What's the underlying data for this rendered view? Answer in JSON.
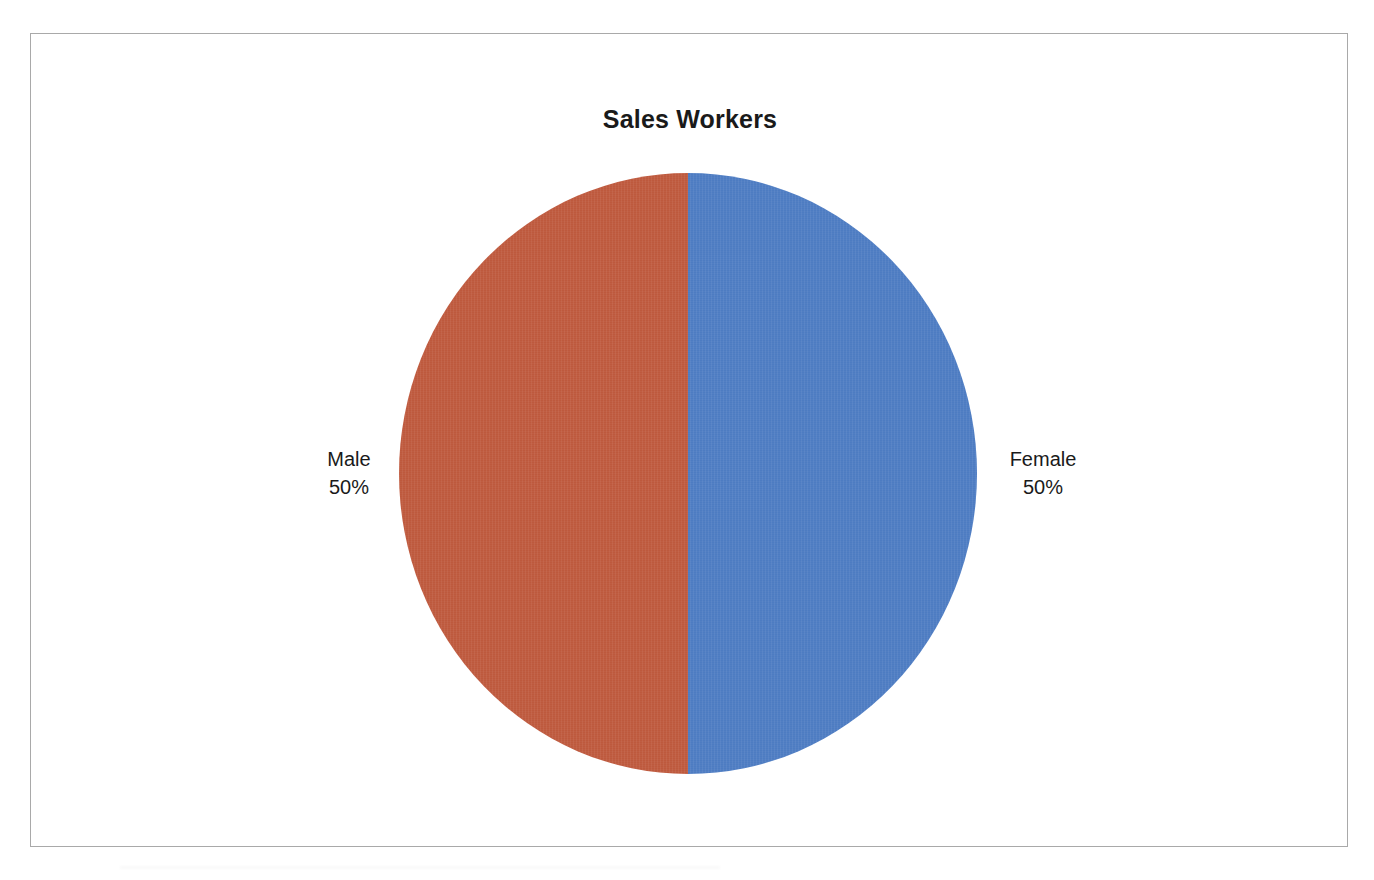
{
  "chart_data": {
    "type": "pie",
    "title": "Sales Workers",
    "categories": [
      "Male",
      "Female"
    ],
    "values": [
      50,
      50
    ],
    "value_labels": [
      "50%",
      "50%"
    ],
    "slices": [
      {
        "name": "Male",
        "value": 50,
        "percent_label": "50%",
        "color": "#c05a3e",
        "side": "left"
      },
      {
        "name": "Female",
        "value": 50,
        "percent_label": "50%",
        "color": "#4e7dc4",
        "side": "right"
      }
    ],
    "legend": "none",
    "labels_position": "outside",
    "xlabel": "",
    "ylabel": "",
    "grid": false
  },
  "colors": {
    "male_slice": "#c05a3e",
    "female_slice": "#4e7dc4",
    "frame_border": "#a9a9a9",
    "background": "#ffffff",
    "text": "#1a1a1a"
  },
  "labels": {
    "male_name": "Male",
    "male_percent": "50%",
    "female_name": "Female",
    "female_percent": "50%"
  }
}
